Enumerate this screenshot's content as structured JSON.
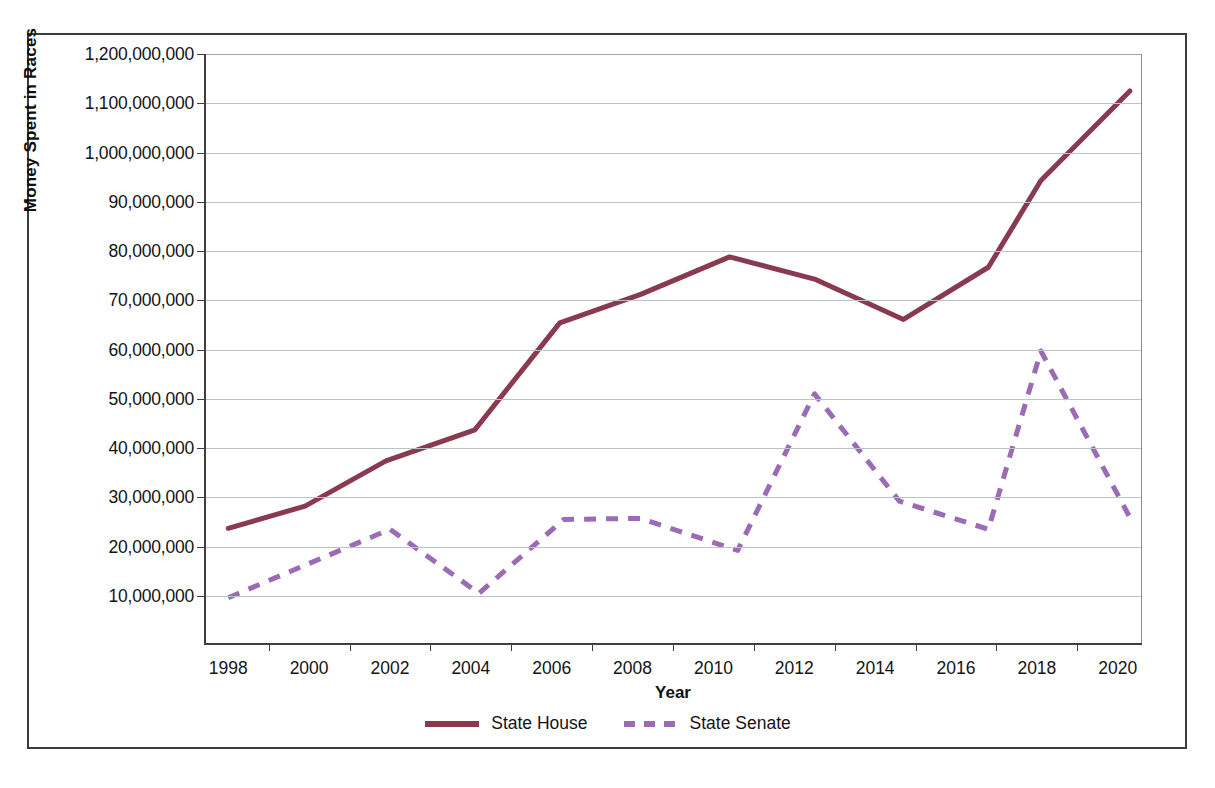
{
  "chart_data": {
    "type": "line",
    "title": "",
    "xlabel": "Year",
    "ylabel": "Money Spent in Races",
    "x": [
      1998,
      2000,
      2002,
      2004,
      2006,
      2008,
      2010,
      2012,
      2014,
      2016,
      2018,
      2020
    ],
    "xlim": [
      1997.4,
      2020.6
    ],
    "ylim": [
      0,
      120000000
    ],
    "ytick_values": [
      10000000,
      20000000,
      30000000,
      40000000,
      50000000,
      60000000,
      70000000,
      80000000,
      90000000,
      100000000,
      110000000,
      120000000
    ],
    "ytick_labels": [
      "10,000,000",
      "20,000,000",
      "30,000,000",
      "40,000,000",
      "50,000,000",
      "60,000,000",
      "70,000,000",
      "80,000,000",
      "90,000,000",
      "1,000,000,000",
      "1,100,000,000",
      "1,200,000,000"
    ],
    "xtick_labels": [
      "1998",
      "2000",
      "2002",
      "2004",
      "2006",
      "2008",
      "2010",
      "2012",
      "2014",
      "2016",
      "2018",
      "2020"
    ],
    "grid": "horizontal",
    "legend_position": "bottom-center",
    "series": [
      {
        "name": "State House",
        "color": "#8a3a4f",
        "style": "solid",
        "width": 5,
        "points": [
          {
            "x": 1998.0,
            "y": 23700000
          },
          {
            "x": 1999.9,
            "y": 28200000
          },
          {
            "x": 2001.9,
            "y": 37400000
          },
          {
            "x": 2004.1,
            "y": 43700000
          },
          {
            "x": 2006.2,
            "y": 65400000
          },
          {
            "x": 2008.2,
            "y": 71200000
          },
          {
            "x": 2010.4,
            "y": 78800000
          },
          {
            "x": 2012.5,
            "y": 74300000
          },
          {
            "x": 2014.7,
            "y": 66100000
          },
          {
            "x": 2016.8,
            "y": 76700000
          },
          {
            "x": 2018.1,
            "y": 94300000
          },
          {
            "x": 2020.3,
            "y": 112500000
          }
        ]
      },
      {
        "name": "State Senate",
        "color": "#9b6bb5",
        "style": "dashed",
        "width": 5,
        "points": [
          {
            "x": 1998.0,
            "y": 9600000
          },
          {
            "x": 2002.0,
            "y": 23500000
          },
          {
            "x": 2004.2,
            "y": 10500000
          },
          {
            "x": 2006.3,
            "y": 25500000
          },
          {
            "x": 2008.2,
            "y": 25700000
          },
          {
            "x": 2010.6,
            "y": 19200000
          },
          {
            "x": 2012.5,
            "y": 51000000
          },
          {
            "x": 2014.6,
            "y": 29200000
          },
          {
            "x": 2016.8,
            "y": 23500000
          },
          {
            "x": 2018.1,
            "y": 59700000
          },
          {
            "x": 2020.3,
            "y": 25900000
          }
        ]
      }
    ]
  },
  "legend": {
    "items": [
      {
        "label": "State House",
        "color": "#8a3a4f",
        "style": "solid"
      },
      {
        "label": "State Senate",
        "color": "#9b6bb5",
        "style": "dashed"
      }
    ]
  },
  "axes": {
    "x_title": "Year",
    "y_title": "Money Spent in Races"
  }
}
